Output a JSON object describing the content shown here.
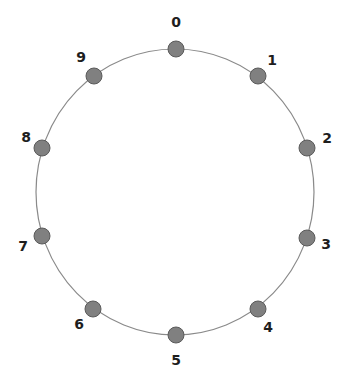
{
  "diagram": {
    "type": "ring",
    "center": {
      "x": 175,
      "y": 192
    },
    "radius": {
      "rx": 139,
      "ry": 143
    },
    "colors": {
      "ring": "#8a8a8a",
      "node_fill": "#808080",
      "node_stroke": "#5a5a5a",
      "label": "#1e1e1e"
    },
    "node_radius": 8,
    "nodes": [
      {
        "id": "0",
        "label": "0",
        "x": 176,
        "y": 49,
        "lx": 176,
        "ly": 22
      },
      {
        "id": "1",
        "label": "1",
        "x": 258,
        "y": 76,
        "lx": 272,
        "ly": 60
      },
      {
        "id": "2",
        "label": "2",
        "x": 307,
        "y": 148,
        "lx": 327,
        "ly": 138
      },
      {
        "id": "3",
        "label": "3",
        "x": 307,
        "y": 238,
        "lx": 326,
        "ly": 244
      },
      {
        "id": "4",
        "label": "4",
        "x": 258,
        "y": 309,
        "lx": 268,
        "ly": 327
      },
      {
        "id": "5",
        "label": "5",
        "x": 176,
        "y": 335,
        "lx": 176,
        "ly": 360
      },
      {
        "id": "6",
        "label": "6",
        "x": 93,
        "y": 309,
        "lx": 79,
        "ly": 324
      },
      {
        "id": "7",
        "label": "7",
        "x": 42,
        "y": 236,
        "lx": 23,
        "ly": 246
      },
      {
        "id": "8",
        "label": "8",
        "x": 42,
        "y": 148,
        "lx": 26,
        "ly": 137
      },
      {
        "id": "9",
        "label": "9",
        "x": 94,
        "y": 76,
        "lx": 81,
        "ly": 57
      }
    ]
  }
}
